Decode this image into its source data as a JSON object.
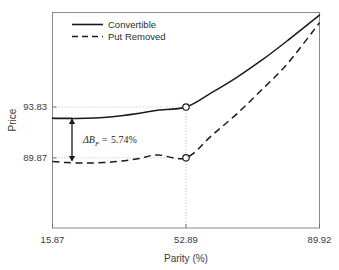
{
  "chart_data": {
    "type": "line",
    "title": "",
    "xlabel": "Parity (%)",
    "ylabel": "Price",
    "xlim": [
      15.87,
      89.92
    ],
    "ylim": [
      84.4,
      101.2
    ],
    "xticks": [
      "15.87",
      "52.89",
      "89.92"
    ],
    "xtick_values": [
      15.87,
      52.89,
      89.92
    ],
    "yticks": [
      "93.83",
      "89.87"
    ],
    "ytick_values": [
      93.83,
      89.87
    ],
    "grid": false,
    "legend_position": "top-left-inside",
    "series": [
      {
        "name": "Convertible",
        "style": "solid",
        "color": "#1a1a1a",
        "x": [
          15.87,
          20.0,
          25.0,
          30.0,
          35.0,
          40.0,
          45.0,
          52.89,
          60.0,
          67.0,
          74.0,
          81.0,
          89.92
        ],
        "values": [
          92.95,
          92.93,
          92.95,
          93.02,
          93.15,
          93.34,
          93.58,
          93.83,
          94.95,
          96.15,
          97.5,
          99.0,
          101.0
        ]
      },
      {
        "name": "Put Removed",
        "style": "dashed",
        "color": "#1a1a1a",
        "x": [
          15.87,
          20.0,
          25.0,
          30.0,
          35.0,
          40.0,
          45.0,
          52.89,
          60.0,
          67.0,
          74.0,
          81.0,
          89.92
        ],
        "values": [
          89.58,
          89.5,
          89.46,
          89.5,
          89.62,
          89.82,
          90.1,
          89.87,
          91.6,
          93.3,
          95.2,
          97.2,
          100.4
        ]
      }
    ],
    "markers": [
      {
        "series": "Convertible",
        "x": 52.89,
        "y": 93.83,
        "shape": "open-circle"
      },
      {
        "series": "Put Removed",
        "x": 52.89,
        "y": 89.87,
        "shape": "open-circle"
      }
    ],
    "leader_lines": [
      {
        "type": "horizontal",
        "y": 93.83,
        "from_x": 15.87,
        "to_x": 52.89,
        "style": "dotted"
      },
      {
        "type": "horizontal",
        "y": 89.87,
        "from_x": 15.87,
        "to_x": 52.89,
        "style": "dotted"
      },
      {
        "type": "vertical",
        "x": 52.89,
        "from_y": 84.4,
        "to_y": 93.83,
        "style": "dotted"
      }
    ],
    "annotations": [
      {
        "name": "delta-bf-arrow",
        "text": "ΔB_F = 5.74%",
        "symbol": "Δ",
        "variable": "B",
        "subscript": "F",
        "equals": "=",
        "value": "5.74%",
        "at_x": 15.87,
        "span_top_y": 92.95,
        "span_bottom_y": 89.58,
        "arrow": "double-headed-vertical"
      }
    ],
    "legend": [
      {
        "label": "Convertible",
        "style": "solid"
      },
      {
        "label": "Put Removed",
        "style": "dashed"
      }
    ]
  }
}
